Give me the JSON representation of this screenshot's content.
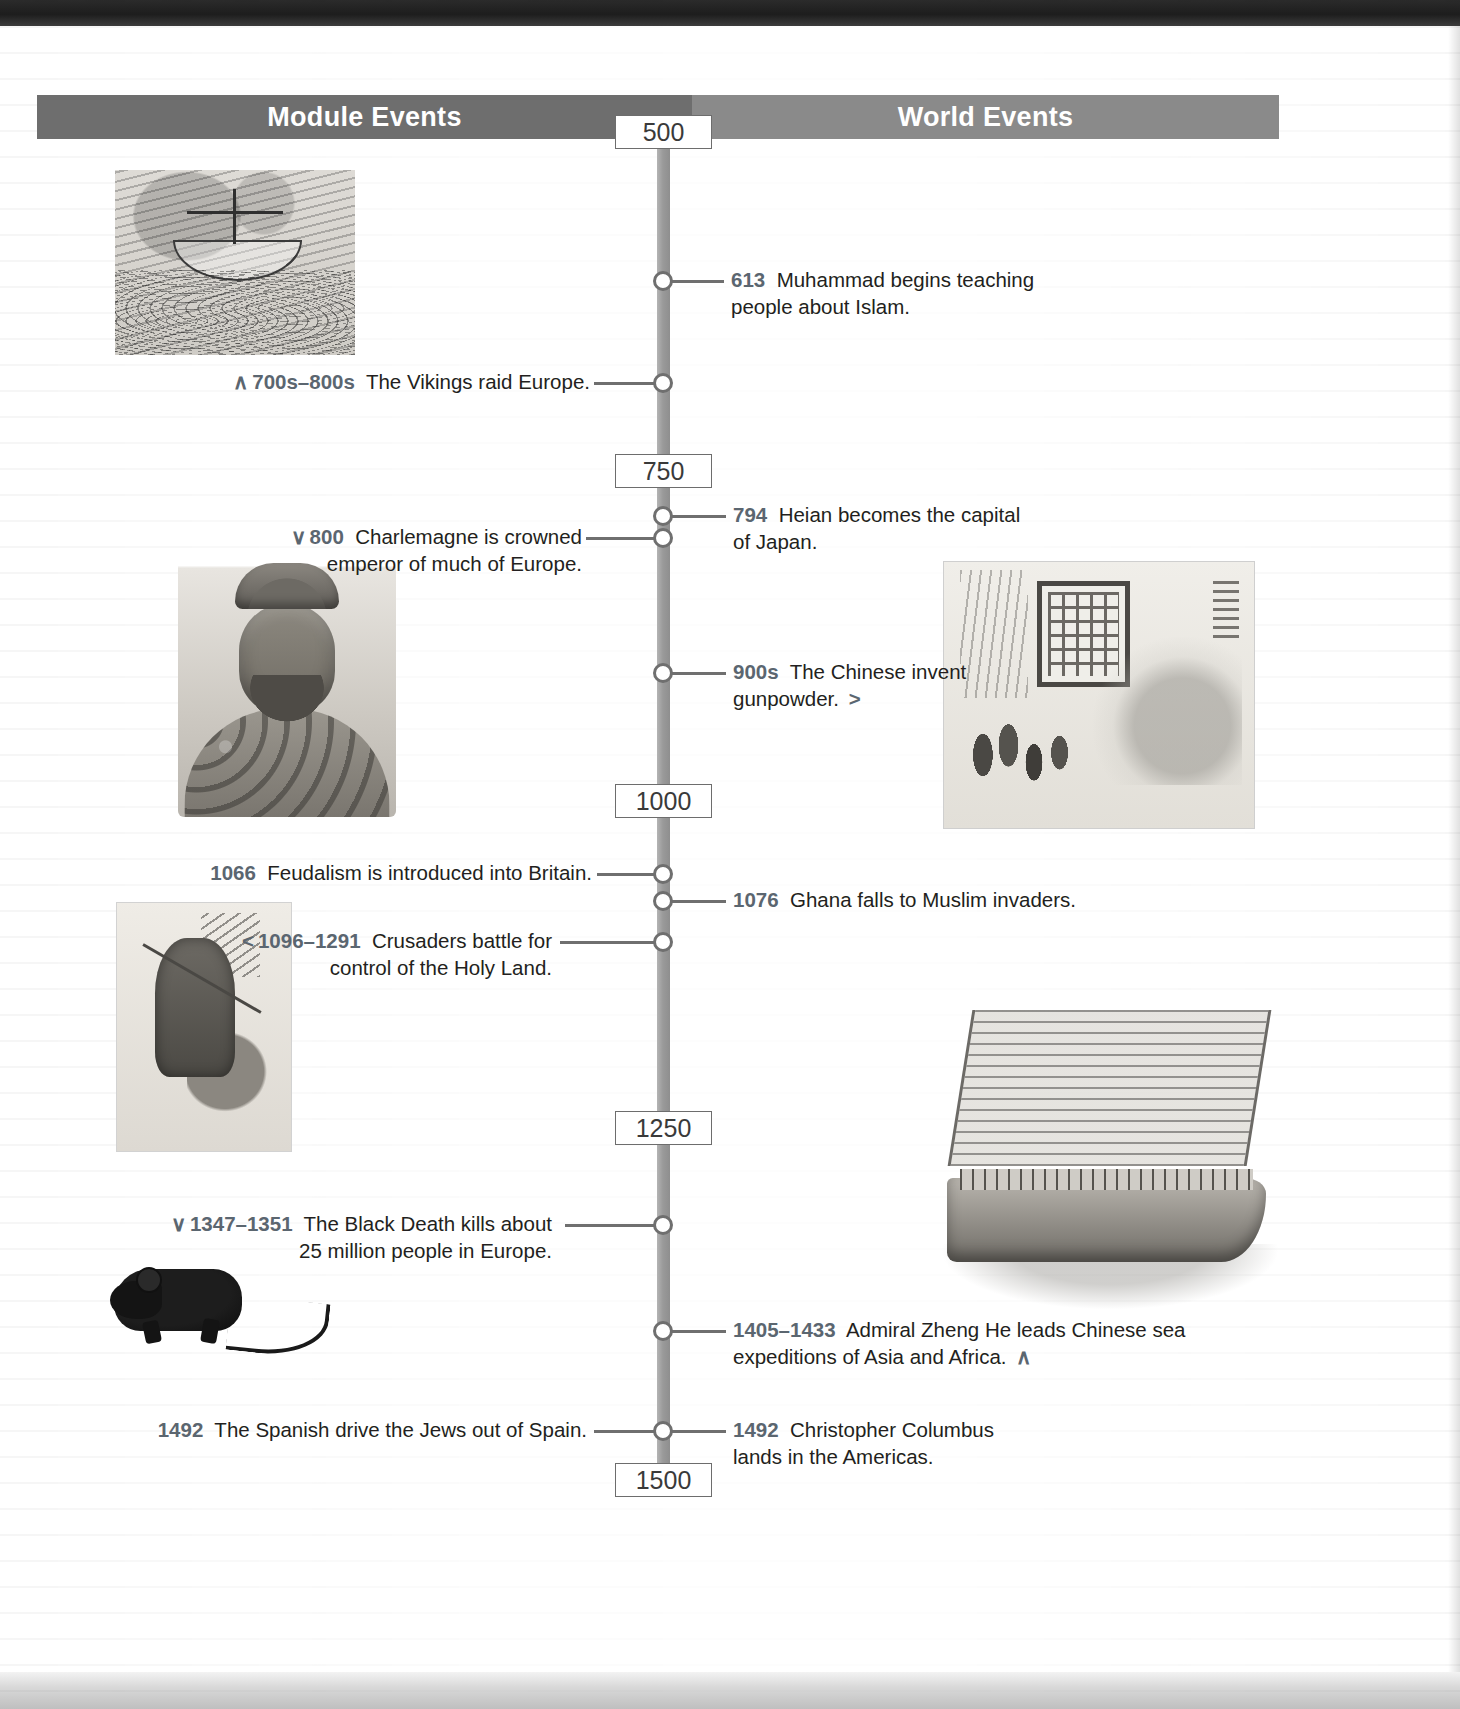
{
  "headers": {
    "left": "Module Events",
    "right": "World Events"
  },
  "dateboxes": [
    {
      "label": "500"
    },
    {
      "label": "750"
    },
    {
      "label": "1000"
    },
    {
      "label": "1250"
    },
    {
      "label": "1500"
    }
  ],
  "events": [
    {
      "side": "right",
      "year": "613",
      "text": "Muhammad begins teaching people about Islam.",
      "arrow": ""
    },
    {
      "side": "left",
      "year": "700s–800s",
      "text": "The Vikings raid Europe.",
      "arrow": "∧"
    },
    {
      "side": "right",
      "year": "794",
      "text": "Heian becomes the capital of Japan.",
      "arrow": ""
    },
    {
      "side": "left",
      "year": "800",
      "text": "Charlemagne is crowned emperor of much of Europe.",
      "arrow": "∨"
    },
    {
      "side": "right",
      "year": "900s",
      "text": "The Chinese invent gunpowder.",
      "arrow": ">"
    },
    {
      "side": "left",
      "year": "1066",
      "text": "Feudalism is introduced into Britain.",
      "arrow": ""
    },
    {
      "side": "right",
      "year": "1076",
      "text": "Ghana falls to Muslim invaders.",
      "arrow": ""
    },
    {
      "side": "left",
      "year": "1096–1291",
      "text": "Crusaders battle for control of the Holy Land.",
      "arrow": "<"
    },
    {
      "side": "left",
      "year": "1347–1351",
      "text": "The Black Death kills about 25 million people in Europe.",
      "arrow": "∨"
    },
    {
      "side": "right",
      "year": "1405–1433",
      "text": "Admiral Zheng He leads Chinese sea expeditions of Asia and Africa.",
      "arrow": "∧"
    },
    {
      "side": "left",
      "year": "1492",
      "text": "The Spanish drive the Jews out of Spain.",
      "arrow": ""
    },
    {
      "side": "right",
      "year": "1492",
      "text": "Christopher Columbus lands in the Americas.",
      "arrow": ""
    }
  ],
  "images": [
    {
      "name": "viking-ship-illustration",
      "caption": "Viking ship woodcut illustration"
    },
    {
      "name": "charlemagne-bust-photo",
      "caption": "Bust of Charlemagne wearing a crown"
    },
    {
      "name": "chinese-gunpowder-painting",
      "caption": "Chinese painting of gunpowder and fireworks"
    },
    {
      "name": "crusader-manuscript-illustration",
      "caption": "Medieval manuscript of a Crusader knight"
    },
    {
      "name": "black-rat-illustration",
      "caption": "Black rat carrying plague"
    },
    {
      "name": "zheng-he-treasure-ship-illustration",
      "caption": "Chinese treasure ship of Zheng He"
    }
  ],
  "colors": {
    "header_left_bg": "#6e6e6e",
    "header_right_bg": "#8a8a8a",
    "spine": "#9a9a9a",
    "year_text": "#5b6670",
    "body_text": "#231f20",
    "datebox_border": "#6d6d6d"
  }
}
